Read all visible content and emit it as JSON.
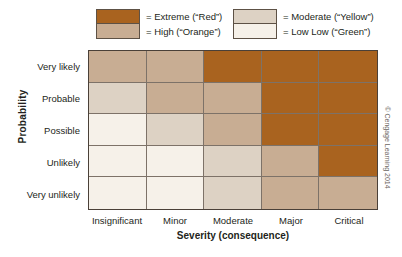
{
  "legend": {
    "items": [
      {
        "label": "= Extreme (“Red”)",
        "level": "extreme",
        "color": "#a9631f"
      },
      {
        "label": "= High (“Orange”)",
        "level": "high",
        "color": "#c8ad93"
      },
      {
        "label": "= Moderate (“Yellow”)",
        "level": "moderate",
        "color": "#ddd2c4"
      },
      {
        "label": "= Low Low (“Green”)",
        "level": "low",
        "color": "#f6f1e9"
      }
    ]
  },
  "axes": {
    "y_title": "Probability",
    "x_title": "Severity (consequence)",
    "y_categories": [
      "Very likely",
      "Probable",
      "Possible",
      "Unlikely",
      "Very unlikely"
    ],
    "x_categories": [
      "Insignificant",
      "Minor",
      "Moderate",
      "Major",
      "Critical"
    ]
  },
  "credit": "© Cengage Learning 2014",
  "colors": {
    "extreme": "#a9631f",
    "high": "#c8ad93",
    "moderate": "#ddd2c4",
    "low": "#f6f1e9",
    "grid_line": "#7d7268",
    "outer_border": "#4a4038",
    "text": "#231f20"
  },
  "chart_data": {
    "type": "heatmap",
    "title": "",
    "xlabel": "Severity (consequence)",
    "ylabel": "Probability",
    "x": [
      "Insignificant",
      "Minor",
      "Moderate",
      "Major",
      "Critical"
    ],
    "y": [
      "Very likely",
      "Probable",
      "Possible",
      "Unlikely",
      "Very unlikely"
    ],
    "legend_position": "top",
    "grid": true,
    "levels": [
      "low",
      "moderate",
      "high",
      "extreme"
    ],
    "level_labels": {
      "low": "Low Low (“Green”)",
      "moderate": "Moderate (“Yellow”)",
      "high": "High (“Orange”)",
      "extreme": "Extreme (“Red”)"
    },
    "level_values": {
      "low": 1,
      "moderate": 2,
      "high": 3,
      "extreme": 4
    },
    "rows": [
      {
        "y": "Very likely",
        "cells": [
          "high",
          "high",
          "extreme",
          "extreme",
          "extreme"
        ],
        "values": [
          3,
          3,
          4,
          4,
          4
        ]
      },
      {
        "y": "Probable",
        "cells": [
          "moderate",
          "high",
          "high",
          "extreme",
          "extreme"
        ],
        "values": [
          2,
          3,
          3,
          4,
          4
        ]
      },
      {
        "y": "Possible",
        "cells": [
          "low",
          "moderate",
          "high",
          "extreme",
          "extreme"
        ],
        "values": [
          1,
          2,
          3,
          4,
          4
        ]
      },
      {
        "y": "Unlikely",
        "cells": [
          "low",
          "low",
          "moderate",
          "high",
          "extreme"
        ],
        "values": [
          1,
          1,
          2,
          3,
          4
        ]
      },
      {
        "y": "Very unlikely",
        "cells": [
          "low",
          "low",
          "moderate",
          "high",
          "high"
        ],
        "values": [
          1,
          1,
          2,
          3,
          3
        ]
      }
    ]
  }
}
